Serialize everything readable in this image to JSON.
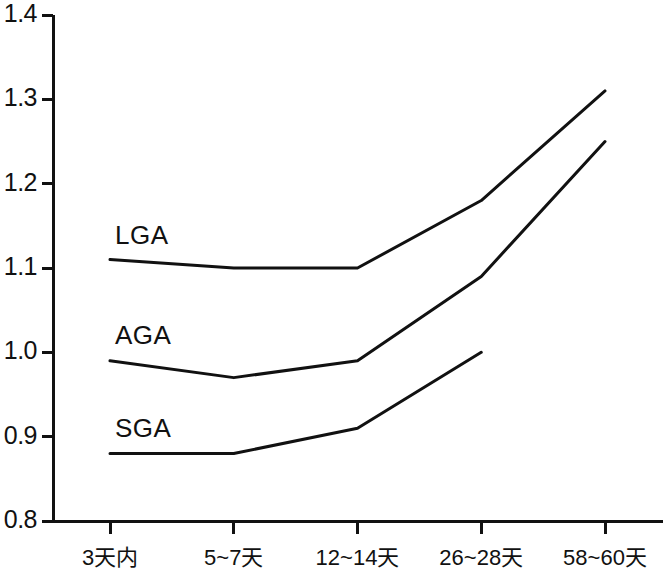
{
  "chart_data": {
    "type": "line",
    "title": "",
    "subtitle": "",
    "xlabel": "",
    "ylabel": "",
    "categories": [
      "3天内",
      "5~7天",
      "12~14天",
      "26~28天",
      "58~60天"
    ],
    "ylim": [
      0.8,
      1.4
    ],
    "yticks": [
      "1.4",
      "1.3",
      "1.2",
      "1.1",
      "1.0",
      "0.9",
      "0.8"
    ],
    "ytick_values": [
      1.4,
      1.3,
      1.2,
      1.1,
      1.0,
      0.9,
      0.8
    ],
    "grid": false,
    "legend": "inline-labels",
    "line_color": "#111111",
    "series": [
      {
        "name": "LGA",
        "values": [
          1.11,
          1.1,
          1.1,
          1.18,
          1.31
        ],
        "label_x": 1.11,
        "label_y": 1.135
      },
      {
        "name": "AGA",
        "values": [
          0.99,
          0.97,
          0.99,
          1.09,
          1.25
        ],
        "label_x": 1.11,
        "label_y": 1.017
      },
      {
        "name": "SGA",
        "values": [
          0.88,
          0.88,
          0.91,
          1.0,
          null
        ],
        "label_x": 1.11,
        "label_y": 0.907
      }
    ]
  }
}
